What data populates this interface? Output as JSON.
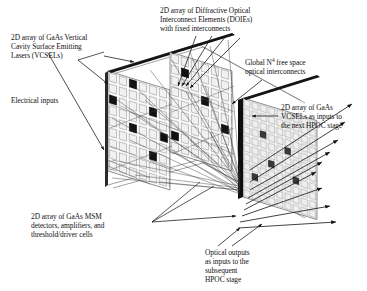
{
  "figure": {
    "domain": "diagram",
    "kind": "3D optoelectronic system schematic",
    "background_color": "#ffffff",
    "ink_color": "#1a1a1a",
    "cell_fill_color": "#f2f2f2",
    "cell_stroke_color": "#8c8c8c",
    "marker_color": "#111111"
  },
  "labels": {
    "vcsel_array": "2D array of GaAs Vertical\nCavity Surface Emitting\nLasers (VCSELs)",
    "electrical_inputs": "Electrical inputs",
    "doie_array": "2D array of Diffractive Optical\nInterconnect Elements (DOIEs)\nwith fixed interconnects",
    "global_interconnects_pre": "Global N",
    "global_interconnects_sup": "4",
    "global_interconnects_post": " free space\noptical interconnects",
    "next_stage_vcsels": "2D array of GaAs\nVCSELs as inputs to\nthe next HPOC stage",
    "msm_detectors": "2D array of GaAs MSM\ndetectors, amplifiers, and\nthreshold/driver cells",
    "optical_outputs": "Optical outputs\nas inputs to the\nsubsequent\nHPOC stage"
  },
  "planes": [
    {
      "name": "vcsel-plane",
      "role": "2D VCSEL emitter array",
      "cols": 7,
      "rows": 8,
      "marked_cells": [
        [
          0,
          2
        ],
        [
          2,
          0
        ],
        [
          2,
          4
        ],
        [
          4,
          2
        ],
        [
          4,
          6
        ],
        [
          6,
          4
        ]
      ]
    },
    {
      "name": "doie-plane",
      "role": "2D diffractive optical element array",
      "cols": 7,
      "rows": 8,
      "marked_cells": [
        [
          1,
          1
        ],
        [
          3,
          3
        ],
        [
          5,
          5
        ],
        [
          6,
          2
        ]
      ]
    },
    {
      "name": "msm-vcsel-plane",
      "role": "MSM detector / driver / VCSEL plane",
      "cols": 9,
      "rows": 11,
      "marked_cells": [
        [
          2,
          3
        ],
        [
          3,
          6
        ],
        [
          5,
          4
        ],
        [
          6,
          7
        ],
        [
          1,
          8
        ]
      ]
    }
  ],
  "flows": {
    "electrical_input_arrows": 1,
    "optical_output_arrows": 9,
    "interconnect_rays": 22
  }
}
